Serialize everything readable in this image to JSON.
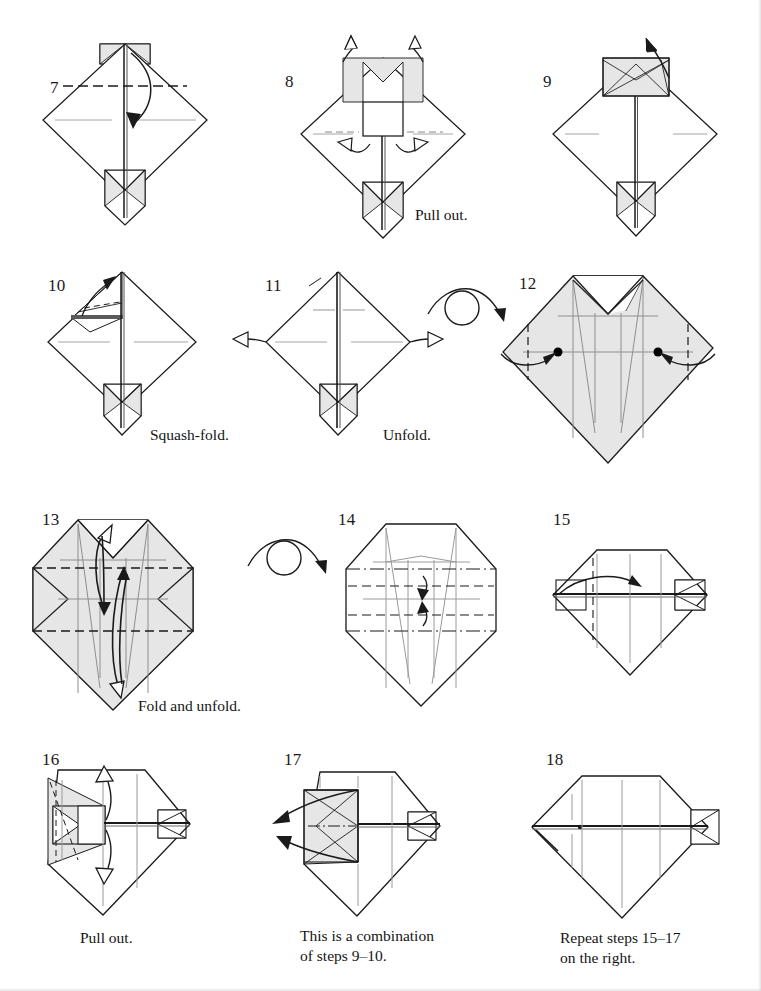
{
  "page": {
    "width": 761,
    "height": 991,
    "background": "#ffffff",
    "ink_color": "#1a1a1a",
    "paper_shade_color": "#e6e6e6",
    "crease_color": "#9a9a9a"
  },
  "steps": [
    {
      "id": "step-7",
      "number": "7",
      "caption": "",
      "arrows": [
        "valley-fold-down-arrow"
      ],
      "shape": "diamond-with-tail",
      "shaded": false
    },
    {
      "id": "step-8",
      "number": "8",
      "caption": "Pull out.",
      "arrows": [
        "hollow-pull-out-up-left",
        "hollow-pull-out-up-right",
        "hollow-pull-out-left",
        "hollow-pull-out-right"
      ],
      "shape": "diamond-with-tail",
      "shaded": true
    },
    {
      "id": "step-9",
      "number": "9",
      "caption": "",
      "arrows": [
        "fold-up-arrow"
      ],
      "shape": "diamond-with-tail",
      "shaded": true
    },
    {
      "id": "step-10",
      "number": "10",
      "caption": "Squash-fold.",
      "arrows": [
        "squash-fold-arrow"
      ],
      "shape": "diamond-with-tail",
      "shaded": true
    },
    {
      "id": "step-11",
      "number": "11",
      "caption": "Unfold.",
      "arrows": [
        "hollow-unfold-left",
        "hollow-unfold-right"
      ],
      "shape": "diamond-with-tail",
      "shaded": true
    },
    {
      "id": "step-12",
      "number": "12",
      "caption": "",
      "arrows": [
        "fold-in-left",
        "fold-in-right"
      ],
      "shape": "shaded-diamond",
      "shaded": true,
      "markers": [
        "reference-dot-left",
        "reference-dot-right"
      ]
    },
    {
      "id": "step-13",
      "number": "13",
      "caption": "Fold and unfold.",
      "arrows": [
        "fold-unfold-up",
        "fold-unfold-down"
      ],
      "shape": "shaded-octagon",
      "shaded": true
    },
    {
      "id": "step-14",
      "number": "14",
      "caption": "",
      "arrows": [
        "fold-down-small",
        "fold-up-small"
      ],
      "shape": "octagon",
      "shaded": false
    },
    {
      "id": "step-15",
      "number": "15",
      "caption": "",
      "arrows": [
        "fold-right-arc"
      ],
      "shape": "flat-diamond",
      "shaded": false
    },
    {
      "id": "step-16",
      "number": "16",
      "caption": "Pull out.",
      "arrows": [
        "hollow-pull-out-up",
        "hollow-pull-out-down"
      ],
      "shape": "flat-diamond",
      "shaded": true
    },
    {
      "id": "step-17",
      "number": "17",
      "caption": "This is a combination\nof steps 9–10.",
      "arrows": [
        "pull-out-upper-left",
        "pull-out-lower-left"
      ],
      "shape": "flat-diamond",
      "shaded": true
    },
    {
      "id": "step-18",
      "number": "18",
      "caption": "Repeat steps 15–17\non the right.",
      "arrows": [],
      "shape": "flat-diamond",
      "shaded": false
    }
  ],
  "symbols": [
    {
      "id": "turn-over-1",
      "name": "turn-over-symbol",
      "after_step": "11"
    },
    {
      "id": "turn-over-2",
      "name": "turn-over-symbol",
      "after_step": "13"
    }
  ]
}
